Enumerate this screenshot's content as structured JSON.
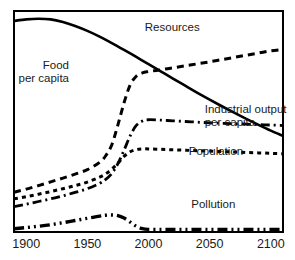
{
  "chart_data": {
    "type": "line",
    "title": "",
    "subtitle": "",
    "xlabel": "",
    "ylabel": "",
    "xlim": [
      1890,
      2110
    ],
    "ylim": [
      0,
      100
    ],
    "grid": false,
    "legend_position": "inline-annotations",
    "xticks": [
      1900,
      1950,
      2000,
      2050,
      2100
    ],
    "xtick_labels": [
      "1900",
      "1950",
      "2000",
      "2050",
      "2100"
    ],
    "yticks": [],
    "ytick_labels": [],
    "series": [
      {
        "name": "Resources",
        "style": "solid",
        "x": [
          1890,
          1900,
          1910,
          1920,
          1930,
          1940,
          1950,
          1960,
          1970,
          1980,
          1990,
          2000,
          2010,
          2020,
          2030,
          2040,
          2050,
          2060,
          2070,
          2080,
          2090,
          2100,
          2110
        ],
        "values": [
          95.5,
          96.2,
          96.5,
          96.2,
          95.0,
          93.2,
          91.0,
          88.4,
          85.5,
          82.4,
          79.2,
          76.0,
          72.7,
          69.4,
          66.2,
          63.0,
          59.9,
          56.9,
          54.0,
          51.2,
          48.5,
          45.9,
          43.5
        ]
      },
      {
        "name": "Food per capita",
        "style": "dashed",
        "x": [
          1890,
          1900,
          1910,
          1920,
          1930,
          1940,
          1950,
          1960,
          1965,
          1970,
          1975,
          1980,
          1985,
          1990,
          1995,
          2000,
          2010,
          2020,
          2030,
          2040,
          2050,
          2060,
          2070,
          2080,
          2090,
          2100,
          2110
        ],
        "values": [
          18.0,
          19.4,
          21.0,
          22.7,
          24.4,
          26.2,
          28.2,
          31.5,
          34.5,
          39.5,
          48.5,
          58.5,
          66.5,
          70.5,
          72.0,
          72.6,
          73.4,
          74.3,
          75.2,
          76.1,
          77.0,
          78.0,
          79.0,
          80.0,
          81.0,
          82.0,
          82.6
        ]
      },
      {
        "name": "Industrial output per capita",
        "style": "dash-dot",
        "x": [
          1890,
          1900,
          1910,
          1920,
          1930,
          1940,
          1950,
          1960,
          1965,
          1970,
          1975,
          1980,
          1985,
          1990,
          1995,
          2000,
          2010,
          2020,
          2030,
          2040,
          2050,
          2060,
          2070,
          2080,
          2090,
          2100,
          2110
        ],
        "values": [
          11.5,
          12.6,
          13.8,
          15.0,
          16.4,
          17.9,
          19.6,
          22.0,
          23.8,
          26.5,
          31.0,
          37.0,
          43.5,
          48.2,
          50.2,
          50.8,
          50.6,
          50.3,
          50.0,
          49.7,
          49.4,
          49.2,
          49.0,
          48.8,
          48.6,
          48.4,
          48.2
        ]
      },
      {
        "name": "Population",
        "style": "dotted",
        "x": [
          1890,
          1900,
          1910,
          1920,
          1930,
          1940,
          1950,
          1960,
          1965,
          1970,
          1975,
          1980,
          1985,
          1990,
          1995,
          2000,
          2010,
          2020,
          2030,
          2040,
          2050,
          2060,
          2070,
          2080,
          2090,
          2100,
          2110
        ],
        "values": [
          15.0,
          16.0,
          17.1,
          18.3,
          19.6,
          21.0,
          22.6,
          24.8,
          26.3,
          28.4,
          31.2,
          34.2,
          36.3,
          37.3,
          37.6,
          37.6,
          37.4,
          37.2,
          37.0,
          36.8,
          36.6,
          36.4,
          36.2,
          36.0,
          35.8,
          35.6,
          35.4
        ]
      },
      {
        "name": "Pollution",
        "style": "dash-dot-dot",
        "x": [
          1890,
          1900,
          1910,
          1920,
          1930,
          1940,
          1950,
          1960,
          1965,
          1970,
          1975,
          1980,
          1985,
          1990,
          1995,
          2000,
          2010,
          2020,
          2030,
          2040,
          2050,
          2060,
          2070,
          2080,
          2090,
          2100,
          2110
        ],
        "values": [
          1.5,
          2.0,
          2.6,
          3.3,
          4.2,
          5.2,
          6.2,
          7.2,
          7.6,
          7.7,
          7.4,
          6.3,
          4.5,
          2.6,
          1.5,
          1.2,
          1.2,
          1.2,
          1.2,
          1.2,
          1.2,
          1.2,
          1.2,
          1.2,
          1.2,
          1.2,
          1.2
        ]
      }
    ],
    "annotations": [
      {
        "key": "resources",
        "text": "Resources",
        "x": 1997,
        "y": 91
      },
      {
        "key": "food1",
        "text": "Food",
        "x": 1935,
        "y": 74
      },
      {
        "key": "food2",
        "text": "per capita",
        "x": 1935,
        "y": 68
      },
      {
        "key": "industrial1",
        "text": "Industrial output",
        "x": 2046,
        "y": 54
      },
      {
        "key": "industrial2",
        "text": "per capita",
        "x": 2046,
        "y": 48
      },
      {
        "key": "population",
        "text": "Population",
        "x": 2033,
        "y": 35
      },
      {
        "key": "pollution",
        "text": "Pollution",
        "x": 2035,
        "y": 11
      }
    ]
  },
  "colors": {
    "line": "#000000",
    "frame": "#000000",
    "text": "#1a1a1a",
    "background": "#ffffff"
  }
}
